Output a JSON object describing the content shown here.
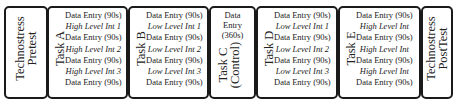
{
  "diagram": {
    "stages": [
      {
        "id": "pretest",
        "label_lines": [
          "Technostress",
          "Pretest"
        ]
      },
      {
        "id": "task-a",
        "label_lines": [
          "Task A"
        ],
        "items": [
          {
            "text": "Data Entry (90s)",
            "italic": false
          },
          {
            "text": "High Level Int 1",
            "italic": true
          },
          {
            "text": "Data Entry (90s)",
            "italic": false
          },
          {
            "text": "High Level Int 2",
            "italic": true
          },
          {
            "text": "Data Entry (90s)",
            "italic": false
          },
          {
            "text": "High Level Int 3",
            "italic": true
          },
          {
            "text": "Data Entry (90s)",
            "italic": false
          }
        ]
      },
      {
        "id": "task-b",
        "label_lines": [
          "Task B"
        ],
        "items": [
          {
            "text": "Data Entry (90s)",
            "italic": false
          },
          {
            "text": "Low Level Int 1",
            "italic": true
          },
          {
            "text": "Data Entry (90s)",
            "italic": false
          },
          {
            "text": "Low Level Int 2",
            "italic": true
          },
          {
            "text": "Data Entry (90s)",
            "italic": false
          },
          {
            "text": "Low Level Int 3",
            "italic": true
          },
          {
            "text": "Data Entry (90s)",
            "italic": false
          }
        ]
      },
      {
        "id": "task-c",
        "label_lines": [
          "Task C",
          "(Control)"
        ],
        "top_text_lines": [
          "Data",
          "Entry",
          "(360s)"
        ]
      },
      {
        "id": "task-d",
        "label_lines": [
          "Task D"
        ],
        "items": [
          {
            "text": "Data Entry (90s)",
            "italic": false
          },
          {
            "text": "Low Level Int 1",
            "italic": true
          },
          {
            "text": "Data Entry (90s)",
            "italic": false
          },
          {
            "text": "Low Level Int 2",
            "italic": true
          },
          {
            "text": "Data Entry (90s)",
            "italic": false
          },
          {
            "text": "Low Level Int 3",
            "italic": true
          },
          {
            "text": "Data Entry (90s)",
            "italic": false
          }
        ]
      },
      {
        "id": "task-e",
        "label_lines": [
          "Task E"
        ],
        "items": [
          {
            "text": "Data Entry (90s)",
            "italic": false
          },
          {
            "text": "High Level Int",
            "italic": true
          },
          {
            "text": "Data Entry (90s)",
            "italic": false
          },
          {
            "text": "High Level Int",
            "italic": true
          },
          {
            "text": "Data Entry (90s)",
            "italic": false
          },
          {
            "text": "High Level Int",
            "italic": true
          },
          {
            "text": "Data Entry (90s)",
            "italic": false
          }
        ]
      },
      {
        "id": "posttest",
        "label_lines": [
          "Technostress",
          "PostTest"
        ]
      }
    ]
  }
}
